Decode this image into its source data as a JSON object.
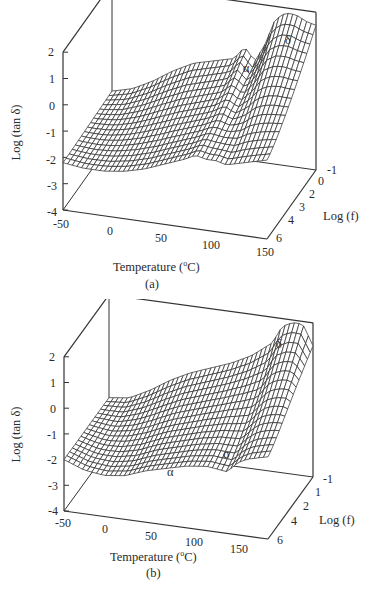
{
  "chart_data": [
    {
      "type": "surface3d",
      "panel_label": "(a)",
      "xlabel": "Temperature (°C)",
      "ylabel": "Log (tan δ)",
      "zlabel": "Log (f)",
      "x_ticks": [
        "-50",
        "0",
        "50",
        "100",
        "150"
      ],
      "y_ticks": [
        "2",
        "1",
        "0",
        "-1",
        "-2",
        "-3",
        "-4"
      ],
      "z_ticks": [
        "-1",
        "0",
        "2",
        "3",
        "4",
        "6"
      ],
      "xlim": [
        -50,
        150
      ],
      "ylim": [
        -4,
        2
      ],
      "zlim": [
        -1,
        6
      ],
      "annotations": [
        {
          "text": "α",
          "x": 80,
          "y": 1.0
        },
        {
          "text": "δ",
          "x": 120,
          "y": 1.7
        }
      ],
      "profile_temperature": [
        -50,
        -30,
        -10,
        10,
        30,
        50,
        70,
        80,
        90,
        100,
        110,
        120,
        130,
        140,
        150
      ],
      "profile_log_tan_delta_low_freq": [
        -2.1,
        -1.9,
        -1.5,
        -1.0,
        -0.6,
        -0.4,
        -0.2,
        0.3,
        -0.2,
        0.5,
        1.5,
        1.8,
        1.8,
        1.6,
        1.5
      ],
      "profile_log_tan_delta_high_freq": [
        -2.2,
        -2.3,
        -2.3,
        -2.2,
        -2.0,
        -1.7,
        -1.4,
        -1.2,
        -1.3,
        -1.3,
        -1.4,
        -1.3,
        -1.2,
        -1.1,
        -1.0
      ]
    },
    {
      "type": "surface3d",
      "panel_label": "(b)",
      "xlabel": "Temperature (°C)",
      "ylabel": "Log (tan δ)",
      "zlabel": "Log (f)",
      "x_ticks": [
        "-50",
        "0",
        "50",
        "100",
        "150"
      ],
      "y_ticks": [
        "2",
        "1",
        "0",
        "-1",
        "-2",
        "-3",
        "-4"
      ],
      "z_ticks": [
        "-1",
        "1",
        "2",
        "4",
        "6"
      ],
      "xlim": [
        -50,
        150
      ],
      "ylim": [
        -4,
        2
      ],
      "zlim": [
        -1,
        6
      ],
      "annotations": [
        {
          "text": "α",
          "x": 40,
          "y": -2.4
        },
        {
          "text": "σ",
          "x": 110,
          "y": -1.8
        },
        {
          "text": "δ",
          "x": 140,
          "y": 1.9
        }
      ],
      "profile_temperature": [
        -50,
        -30,
        -10,
        10,
        30,
        50,
        70,
        90,
        110,
        120,
        130,
        140,
        150
      ],
      "profile_log_tan_delta_low_freq": [
        -2.0,
        -1.9,
        -1.5,
        -1.0,
        -0.6,
        -0.3,
        0.0,
        0.4,
        1.0,
        1.7,
        1.9,
        1.9,
        1.1
      ],
      "profile_log_tan_delta_high_freq": [
        -2.0,
        -2.3,
        -2.4,
        -2.3,
        -2.0,
        -1.8,
        -1.6,
        -1.5,
        -1.6,
        -1.2,
        -1.0,
        -0.9,
        -0.8
      ]
    }
  ],
  "panels": {
    "a": {
      "caption": "(a)",
      "xlabel": "Temperature (",
      "xlabel_sup": "o",
      "xlabel_end": "C)",
      "ylabel": "Log (tan δ)",
      "zlabel": "Log (f)",
      "greek_alpha": "α",
      "greek_delta": "δ",
      "yt": [
        "2",
        "1",
        "0",
        "-1",
        "-2",
        "-3",
        "-4"
      ],
      "xt": [
        "-50",
        "0",
        "50",
        "100",
        "150"
      ],
      "zt": [
        "-1",
        "0",
        "2",
        "3",
        "4",
        "6"
      ]
    },
    "b": {
      "caption": "(b)",
      "xlabel": "Temperature (",
      "xlabel_sup": "o",
      "xlabel_end": "C)",
      "ylabel": "Log (tan δ)",
      "zlabel": "Log (f)",
      "greek_alpha": "α",
      "greek_sigma": "σ",
      "greek_delta": "δ",
      "yt": [
        "2",
        "1",
        "0",
        "-1",
        "-2",
        "-3",
        "-4"
      ],
      "xt": [
        "-50",
        "0",
        "50",
        "100",
        "150"
      ],
      "zt": [
        "-1",
        "1",
        "2",
        "4",
        "6"
      ]
    }
  }
}
